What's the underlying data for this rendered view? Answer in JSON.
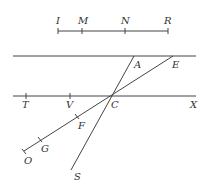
{
  "diagram": {
    "scale_labels": {
      "I": "I",
      "M": "M",
      "N": "N",
      "R": "R"
    },
    "point_labels": {
      "A": "A",
      "E": "E",
      "T": "T",
      "V": "V",
      "C": "C",
      "X": "X",
      "F": "F",
      "G": "G",
      "O": "O",
      "S": "S"
    }
  }
}
